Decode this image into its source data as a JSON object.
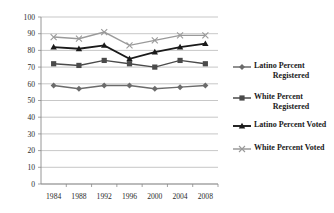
{
  "chart_data": {
    "type": "line",
    "title": "",
    "xlabel": "",
    "ylabel": "",
    "categories": [
      "1984",
      "1988",
      "1992",
      "1996",
      "2000",
      "2004",
      "2008"
    ],
    "ylim": [
      0,
      100
    ],
    "ytick_step": 10,
    "yticks": [
      "0",
      "10",
      "20",
      "30",
      "40",
      "50",
      "60",
      "70",
      "80",
      "90",
      "100"
    ],
    "grid": "horizontal",
    "legend_position": "right",
    "series": [
      {
        "name": "Latino Percent Registered",
        "marker": "diamond",
        "color": "#6b6b6b",
        "values": [
          59,
          57,
          59,
          59,
          57,
          58,
          59
        ]
      },
      {
        "name": "White Percent Registered",
        "marker": "square",
        "color": "#4a4a4a",
        "values": [
          72,
          71,
          74,
          72,
          70,
          74,
          72
        ]
      },
      {
        "name": "Latino Percent Voted",
        "marker": "triangle",
        "color": "#1a1a1a",
        "values": [
          82,
          81,
          83,
          75,
          79,
          82,
          84
        ]
      },
      {
        "name": "White Percent Voted",
        "marker": "cross",
        "color": "#9a9a9a",
        "values": [
          88,
          87,
          91,
          83,
          86,
          89,
          89
        ]
      }
    ]
  },
  "legend": {
    "items": [
      {
        "label_line1": "Latino Percent",
        "label_line2": "Registered"
      },
      {
        "label_line1": "White Percent",
        "label_line2": "Registered"
      },
      {
        "label_line1": "Latino Percent Voted",
        "label_line2": ""
      },
      {
        "label_line1": "White Percent Voted",
        "label_line2": ""
      }
    ]
  },
  "colors": {
    "grid": "#b9b9b9",
    "axis": "#8a8a8a",
    "text": "#2b2b2b",
    "latino_registered": "#6b6b6b",
    "white_registered": "#4a4a4a",
    "latino_voted": "#1a1a1a",
    "white_voted": "#9a9a9a"
  }
}
